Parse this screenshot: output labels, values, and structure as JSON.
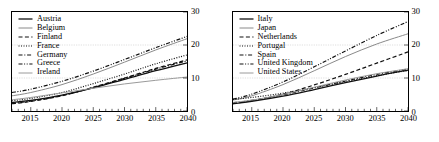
{
  "figure": {
    "panels": [
      {
        "name": "left-panel",
        "legend_title": "",
        "chart_data": {
          "type": "line",
          "title": "",
          "xlabel": "",
          "ylabel": "",
          "xlim": [
            2012,
            2040
          ],
          "ylim": [
            0,
            30
          ],
          "xticks": [
            2015,
            2020,
            2025,
            2030,
            2035,
            2040
          ],
          "yticks": [
            0,
            10,
            20,
            30
          ],
          "grid": true,
          "legend_position": "top-left",
          "x": [
            2012,
            2015,
            2020,
            2025,
            2030,
            2035,
            2040
          ],
          "series": [
            {
              "name": "Austria",
              "style": "solid",
              "color": "#111111",
              "width": 1.3,
              "values": [
                2.6,
                3.2,
                4.8,
                7.0,
                9.6,
                12.2,
                14.6
              ]
            },
            {
              "name": "Belgium",
              "style": "solid",
              "color": "#8a8a8a",
              "width": 1.0,
              "values": [
                4.6,
                5.6,
                8.0,
                11.2,
                14.8,
                18.5,
                21.9
              ]
            },
            {
              "name": "Finland",
              "style": "dashed",
              "color": "#111111",
              "width": 1.2,
              "values": [
                2.2,
                2.9,
                4.6,
                7.2,
                10.0,
                12.9,
                15.5
              ]
            },
            {
              "name": "France",
              "style": "dotted",
              "color": "#111111",
              "width": 1.2,
              "values": [
                3.1,
                3.8,
                5.6,
                8.3,
                11.2,
                14.3,
                17.0
              ]
            },
            {
              "name": "Germany",
              "style": "dash-dot",
              "color": "#111111",
              "width": 1.2,
              "values": [
                2.4,
                3.0,
                4.7,
                7.1,
                9.9,
                12.7,
                15.2
              ]
            },
            {
              "name": "Greece",
              "style": "dash-dot-dot",
              "color": "#111111",
              "width": 1.2,
              "values": [
                5.6,
                6.6,
                9.0,
                12.1,
                15.6,
                19.2,
                22.6
              ]
            },
            {
              "name": "Ireland",
              "style": "solid",
              "color": "#9a9a9a",
              "width": 1.0,
              "values": [
                3.4,
                4.1,
                5.5,
                6.9,
                8.2,
                9.3,
                10.3
              ]
            }
          ]
        }
      },
      {
        "name": "right-panel",
        "legend_title": "",
        "chart_data": {
          "type": "line",
          "title": "",
          "xlabel": "",
          "ylabel": "",
          "xlim": [
            2012,
            2040
          ],
          "ylim": [
            0,
            30
          ],
          "xticks": [
            2015,
            2020,
            2025,
            2030,
            2035,
            2040
          ],
          "yticks": [
            0,
            10,
            20,
            30
          ],
          "grid": true,
          "legend_position": "top-left",
          "x": [
            2012,
            2015,
            2020,
            2025,
            2030,
            2035,
            2040
          ],
          "series": [
            {
              "name": "Italy",
              "style": "solid",
              "color": "#111111",
              "width": 1.3,
              "values": [
                2.2,
                2.9,
                4.5,
                6.5,
                8.6,
                10.6,
                12.4
              ]
            },
            {
              "name": "Japan",
              "style": "solid",
              "color": "#8a8a8a",
              "width": 1.0,
              "values": [
                3.3,
                4.6,
                8.0,
                12.2,
                16.5,
                20.3,
                23.4
              ]
            },
            {
              "name": "Netherlands",
              "style": "dashed",
              "color": "#111111",
              "width": 1.2,
              "values": [
                2.3,
                3.1,
                5.1,
                7.9,
                11.1,
                14.5,
                17.9
              ]
            },
            {
              "name": "Portugal",
              "style": "dotted",
              "color": "#111111",
              "width": 1.2,
              "values": [
                3.5,
                4.1,
                5.4,
                7.1,
                8.9,
                10.7,
                12.3
              ]
            },
            {
              "name": "Spain",
              "style": "dash-dot",
              "color": "#111111",
              "width": 1.2,
              "values": [
                2.5,
                3.2,
                4.9,
                7.0,
                9.1,
                11.1,
                12.7
              ]
            },
            {
              "name": "United Kingdom",
              "style": "dash-dot-dot",
              "color": "#111111",
              "width": 1.2,
              "values": [
                3.6,
                5.1,
                8.8,
                13.4,
                18.2,
                22.9,
                27.1
              ]
            },
            {
              "name": "United States",
              "style": "solid",
              "color": "#9a9a9a",
              "width": 1.0,
              "values": [
                2.6,
                3.3,
                5.0,
                7.2,
                9.4,
                11.3,
                12.8
              ]
            }
          ]
        }
      }
    ]
  }
}
